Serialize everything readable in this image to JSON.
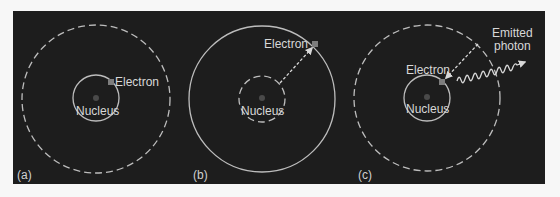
{
  "figure": {
    "background_color": "#1d1d1d",
    "line_color": "#bdbdbd",
    "panels": [
      {
        "id": "a",
        "label": "(a)",
        "electron_label": "Electron",
        "nucleus_label": "Nucleus",
        "inner_orbit": "solid",
        "outer_orbit": "dashed",
        "electron_orbit": "inner"
      },
      {
        "id": "b",
        "label": "(b)",
        "electron_label": "Electron",
        "nucleus_label": "Nucleus",
        "inner_orbit": "dashed",
        "outer_orbit": "solid",
        "electron_orbit": "outer",
        "transition": "inner-to-outer (excitation)"
      },
      {
        "id": "c",
        "label": "(c)",
        "electron_label": "Electron",
        "nucleus_label": "Nucleus",
        "inner_orbit": "solid",
        "outer_orbit": "dashed",
        "electron_orbit": "inner",
        "transition": "outer-to-inner (de-excitation)",
        "photon_label_line1": "Emitted",
        "photon_label_line2": "photon"
      }
    ]
  }
}
